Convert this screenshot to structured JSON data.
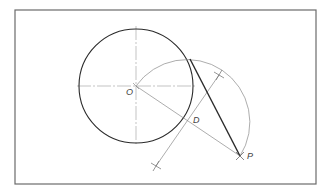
{
  "diagram": {
    "labels": {
      "center": "O",
      "midpoint": "D",
      "external_point": "P"
    },
    "colors": {
      "background": "#ffffff",
      "frame": "#6b6b6b",
      "thick_line": "#2a2a2a",
      "thin_line": "#8a8a8a",
      "center_line": "#9a9a9a"
    },
    "geometry": {
      "frame": {
        "x": 15,
        "y": 10,
        "w": 301,
        "h": 174
      },
      "circle": {
        "cx": 136,
        "cy": 86,
        "r": 57
      },
      "point_O": {
        "x": 136,
        "y": 86
      },
      "point_P": {
        "x": 240,
        "y": 156
      },
      "point_D": {
        "x": 188,
        "y": 121
      },
      "tangent_point": {
        "x": 190,
        "y": 59
      },
      "arc_radius": 62.7,
      "bisector": {
        "x1": 156,
        "y1": 166,
        "x2": 219,
        "y2": 75
      }
    }
  }
}
